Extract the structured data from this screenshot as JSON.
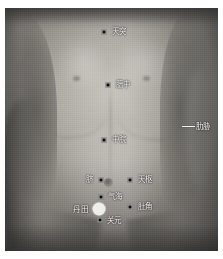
{
  "figure": {
    "kind": "anatomical-photograph",
    "rendering": "grayscale photo",
    "border_color": "#ffffff",
    "marker_color": "#0c0c0c",
    "label_color": "#fdfdfd",
    "highlight_marker_color": "#ededea"
  },
  "points": [
    {
      "id": "tiantu",
      "label": "天突",
      "x": 104,
      "y": 32,
      "label_x": 112,
      "label_y": 31,
      "side": "left",
      "marker": "dot"
    },
    {
      "id": "danzhong",
      "label": "膻中",
      "x": 108,
      "y": 85,
      "label_x": 116,
      "label_y": 84,
      "side": "left",
      "marker": "dot"
    },
    {
      "id": "zhongwan",
      "label": "中脘",
      "x": 104,
      "y": 140,
      "label_x": 112,
      "label_y": 139,
      "side": "left",
      "marker": "dot"
    },
    {
      "id": "qi",
      "label": "脐",
      "x": 101,
      "y": 180,
      "label_x": 93,
      "label_y": 179,
      "side": "right",
      "marker": "dot"
    },
    {
      "id": "tianshu",
      "label": "天枢",
      "x": 130,
      "y": 180,
      "label_x": 138,
      "label_y": 179,
      "side": "left",
      "marker": "dot"
    },
    {
      "id": "qihai",
      "label": "气海",
      "x": 101,
      "y": 197,
      "label_x": 108,
      "label_y": 196,
      "side": "left",
      "marker": "dot"
    },
    {
      "id": "dujiao",
      "label": "肚角",
      "x": 130,
      "y": 207,
      "label_x": 138,
      "label_y": 206,
      "side": "left",
      "marker": "dot"
    },
    {
      "id": "dantian",
      "label": "丹田",
      "x": 99,
      "y": 209,
      "label_x": 88,
      "label_y": 209,
      "side": "right",
      "marker": "circle"
    },
    {
      "id": "guanyuan",
      "label": "关元",
      "x": 100,
      "y": 220,
      "label_x": 107,
      "label_y": 220,
      "side": "left",
      "marker": "dot"
    }
  ],
  "leader_labels": [
    {
      "id": "leixie",
      "label": "肋胁",
      "line_x": 182,
      "line_y": 126,
      "line_w": 13,
      "label_x": 196,
      "label_y": 126
    }
  ]
}
